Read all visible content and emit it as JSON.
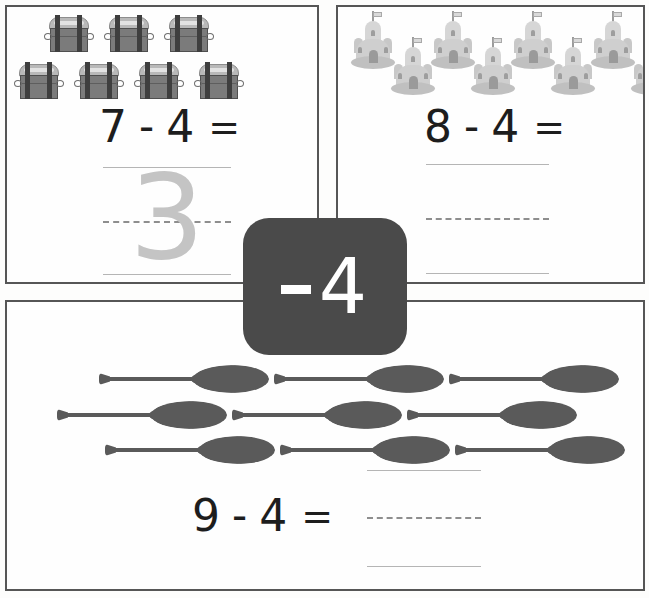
{
  "worksheet": {
    "title": "Subtraction Practice Worksheet",
    "operation_badge": {
      "minus_sign": "-",
      "value": "4",
      "full_label": "-4",
      "background_color": "#4a4a4a",
      "text_color": "#ffffff"
    },
    "panels": [
      {
        "id": "panel-1",
        "icon_name": "treasure-chest-icon",
        "icon_label": "treasure chest",
        "icon_count": 7,
        "icon_rows": [
          3,
          4
        ],
        "equation": {
          "minuend": "7",
          "operator": "-",
          "subtrahend": "4",
          "equals": "=",
          "answer": "3",
          "answer_filled": true,
          "answer_style": "traced"
        },
        "handwriting_lines": {
          "top": "solid",
          "middle": "dashed",
          "bottom": "solid"
        }
      },
      {
        "id": "panel-2",
        "icon_name": "sandcastle-icon",
        "icon_label": "sandcastle",
        "icon_count": 8,
        "icon_rows": [
          8
        ],
        "arrangement": "zigzag",
        "equation": {
          "minuend": "8",
          "operator": "-",
          "subtrahend": "4",
          "equals": "=",
          "answer": "",
          "answer_filled": false,
          "answer_style": "blank"
        },
        "handwriting_lines": {
          "top": "solid",
          "middle": "dashed",
          "bottom": "solid"
        }
      },
      {
        "id": "panel-3",
        "icon_name": "paddle-icon",
        "icon_label": "paddle",
        "icon_count": 9,
        "icon_rows": [
          3,
          3,
          3
        ],
        "equation": {
          "minuend": "9",
          "operator": "-",
          "subtrahend": "4",
          "equals": "=",
          "answer": "",
          "answer_filled": false,
          "answer_style": "blank"
        },
        "handwriting_lines": {
          "top": "solid",
          "middle": "dashed",
          "bottom": "solid"
        }
      }
    ],
    "colors": {
      "panel_border": "#565656",
      "page_background": "#fdfdfc",
      "equation_text": "#1d1d1d",
      "trace_digit": "#c4c4c4",
      "guide_line_solid": "#b5b5b5",
      "guide_line_dashed": "#8e8e8e",
      "paddle_fill": "#5a5a5a",
      "chest_fill": "#7b7b7b",
      "castle_fill": "#cfcfcf"
    }
  }
}
